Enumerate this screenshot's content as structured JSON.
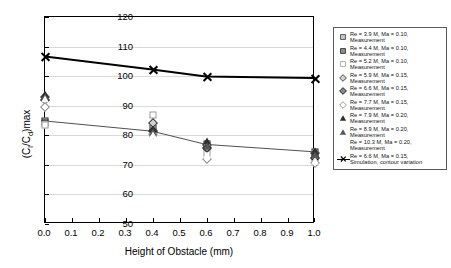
{
  "chart_data": {
    "type": "scatter",
    "title": "",
    "xlabel": "Height of Obstacle (mm)",
    "ylabel": "(Cl/Cd)max",
    "ylabel_parts": {
      "prefix": "(C",
      "sub1": "l",
      "mid": "/C",
      "sub2": "d",
      "suffix": ")max"
    },
    "xlim": [
      0.0,
      1.0
    ],
    "ylim": [
      50,
      120
    ],
    "xticks": [
      "0.0",
      "0.1",
      "0.2",
      "0.3",
      "0.4",
      "0.5",
      "0.6",
      "0.7",
      "0.8",
      "0.9",
      "1.0"
    ],
    "yticks": [
      "50",
      "60",
      "70",
      "80",
      "90",
      "100",
      "110",
      "120"
    ],
    "grid": "horizontal",
    "legend_position": "right-outside",
    "x": [
      0.0,
      0.4,
      0.6,
      1.0
    ],
    "series": [
      {
        "name": "Re = 3.9 M, Ma = 0.10, Measurement",
        "marker": "square",
        "fill": "gray",
        "values": [
          85.0,
          82.5,
          77.0,
          74.3
        ]
      },
      {
        "name": "Re = 4.4 M, Ma = 0.10, Measurement",
        "marker": "square",
        "fill": "dark",
        "values": [
          84.2,
          80.8,
          76.0,
          72.8
        ]
      },
      {
        "name": "Re = 5.2 M, Ma = 0.10, Measurement",
        "marker": "square",
        "fill": "open",
        "values": [
          83.5,
          86.8,
          74.0,
          70.8
        ]
      },
      {
        "name": "Re = 5.9 M, Ma = 0.15, Measurement",
        "marker": "diamond",
        "fill": "gray",
        "values": [
          92.8,
          84.3,
          76.8,
          74.0
        ]
      },
      {
        "name": "Re = 6.6 M, Ma = 0.15, Measurement",
        "marker": "diamond",
        "fill": "dark",
        "values": [
          92.0,
          81.6,
          75.6,
          72.2
        ]
      },
      {
        "name": "Re = 7.7 M, Ma = 0.15, Measurement",
        "marker": "diamond",
        "fill": "open",
        "values": [
          89.6,
          80.3,
          72.0,
          70.5
        ]
      },
      {
        "name": "Re = 7.9 M, Ma = 0.20, Measurement",
        "marker": "triangle",
        "fill": "dark",
        "values": [
          93.8,
          82.2,
          78.0,
          74.8
        ]
      },
      {
        "name": "Re = 8.9 M, Ma = 0.20, Measurement",
        "marker": "triangle",
        "fill": "gray",
        "values": [
          93.0,
          81.2,
          76.4,
          73.4
        ]
      },
      {
        "name": "Re = 10.3 M, Ma = 0.20, Measurement",
        "marker": "triangle",
        "fill": "open",
        "values": [
          92.4,
          80.0,
          73.2,
          71.4
        ]
      },
      {
        "name": "Re = 6.6 M, Ma = 0.15, Simulation, contour variation",
        "marker": "x-line",
        "fill": "black",
        "values": [
          106.5,
          102.1,
          99.7,
          99.2
        ]
      }
    ],
    "trend_lines": [
      {
        "name": "simulation-line",
        "x": [
          0.0,
          0.4,
          0.6,
          1.0
        ],
        "y": [
          106.5,
          102.1,
          99.7,
          99.2
        ],
        "width": 2.0,
        "color": "#000000"
      },
      {
        "name": "measurement-line",
        "x": [
          0.0,
          0.4,
          0.6,
          1.0
        ],
        "y": [
          84.5,
          81.0,
          76.5,
          74.0
        ],
        "width": 1.0,
        "color": "#4d4d4d"
      }
    ]
  },
  "legend": {
    "entries": [
      {
        "label_line1": "Re = 3.9 M, Ma = 0.10,",
        "label_line2": "Measurement",
        "marker": "square",
        "fill": "gray"
      },
      {
        "label_line1": "Re = 4.4 M, Ma = 0.10,",
        "label_line2": "Measurement",
        "marker": "square",
        "fill": "dark"
      },
      {
        "label_line1": "Re = 5.2 M, Ma = 0.10,",
        "label_line2": "Measurement",
        "marker": "square",
        "fill": "open"
      },
      {
        "label_line1": "Re = 5.9 M, Ma = 0.15,",
        "label_line2": "Measurement",
        "marker": "diamond",
        "fill": "gray"
      },
      {
        "label_line1": "Re = 6.6 M, Ma = 0.15,",
        "label_line2": "Measurement",
        "marker": "diamond",
        "fill": "dark"
      },
      {
        "label_line1": "Re = 7.7 M, Ma = 0.15,",
        "label_line2": "Measurement",
        "marker": "diamond",
        "fill": "open"
      },
      {
        "label_line1": "Re = 7.9 M, Ma = 0.20,",
        "label_line2": "Measurement",
        "marker": "triangle",
        "fill": "dark"
      },
      {
        "label_line1": "Re = 8.9 M, Ma = 0.20,",
        "label_line2": "Measurement",
        "marker": "triangle",
        "fill": "gray"
      },
      {
        "label_line1": "Re = 10.3 M, Ma = 0.20,",
        "label_line2": "Measurement",
        "marker": "triangle",
        "fill": "open"
      },
      {
        "label_line1": "Re = 6.6 M, Ma = 0.15,",
        "label_line2": "Simulation, contour variation",
        "marker": "x-line",
        "fill": "black"
      }
    ]
  }
}
